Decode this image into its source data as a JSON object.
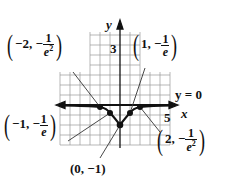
{
  "figure": {
    "axes": {
      "x_label": "x",
      "y_label": "y",
      "x_tick_label": "5",
      "y_tick_label": "3"
    },
    "asymptote_label": "y = 0",
    "points": [
      {
        "id": "p_neg2",
        "x": "−2",
        "y_prefix": "−",
        "y_num": "1",
        "y_den": "e",
        "y_den_exp": "2"
      },
      {
        "id": "p_neg1",
        "x": "−1",
        "y_prefix": "−",
        "y_num": "1",
        "y_den": "e",
        "y_den_exp": ""
      },
      {
        "id": "p_0",
        "text": "(0, −1)"
      },
      {
        "id": "p_1",
        "x": "1",
        "y_prefix": "−",
        "y_num": "1",
        "y_den": "e",
        "y_den_exp": ""
      },
      {
        "id": "p_2",
        "x": "2",
        "y_prefix": "−",
        "y_num": "1",
        "y_den": "e",
        "y_den_exp": "2"
      }
    ],
    "colors": {
      "grid": "#9a9a9a",
      "axis": "#111111",
      "curve": "#111111",
      "leader": "#333333"
    }
  }
}
